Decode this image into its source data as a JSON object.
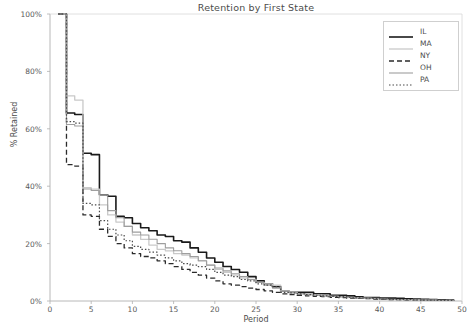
{
  "chart": {
    "title": "Retention by First State",
    "xlabel": "Period",
    "ylabel": "% Retained"
  },
  "axes": {
    "xticks": [
      "0",
      "5",
      "10",
      "15",
      "20",
      "25",
      "30",
      "35",
      "40",
      "45",
      "50"
    ],
    "yticks": [
      "0%",
      "20%",
      "40%",
      "60%",
      "80%",
      "100%"
    ]
  },
  "legend": {
    "items": [
      {
        "label": "IL",
        "style": "solid",
        "color": "#1a1a1a",
        "width": 1.6,
        "dash": "none"
      },
      {
        "label": "MA",
        "style": "solid-light",
        "color": "#c9c9c9",
        "width": 1.3,
        "dash": "none"
      },
      {
        "label": "NY",
        "style": "dashed",
        "color": "#2b2b2b",
        "width": 1.3,
        "dash": "5,3"
      },
      {
        "label": "OH",
        "style": "solid-gray",
        "color": "#9e9e9e",
        "width": 1.1,
        "dash": "none"
      },
      {
        "label": "PA",
        "style": "dotted",
        "color": "#4a4a4a",
        "width": 1.2,
        "dash": "1.5,2"
      }
    ]
  },
  "chart_data": {
    "type": "line",
    "title": "Retention by First State",
    "xlabel": "Period",
    "ylabel": "% Retained",
    "xlim": [
      0,
      50
    ],
    "ylim": [
      0,
      100
    ],
    "grid": false,
    "legend_position": "upper right",
    "x": [
      1,
      2,
      3,
      4,
      5,
      6,
      7,
      8,
      9,
      10,
      11,
      12,
      13,
      14,
      15,
      16,
      17,
      18,
      19,
      20,
      21,
      22,
      23,
      24,
      25,
      26,
      27,
      28,
      29,
      30,
      31,
      32,
      33,
      34,
      35,
      36,
      37,
      38,
      39,
      40,
      41,
      42,
      43,
      44,
      45,
      46,
      47,
      48,
      49
    ],
    "series": [
      {
        "name": "IL",
        "color": "#1a1a1a",
        "linestyle": "solid",
        "values": [
          100,
          65.5,
          65.0,
          51.5,
          51.0,
          37.0,
          36.5,
          29.5,
          29.0,
          27.0,
          25.5,
          24.5,
          23.0,
          22.5,
          21.0,
          20.5,
          18.5,
          17.0,
          15.0,
          13.5,
          12.0,
          11.0,
          10.0,
          8.5,
          7.0,
          6.0,
          5.0,
          3.5,
          3.0,
          3.0,
          3.0,
          2.5,
          2.5,
          2.0,
          2.0,
          1.8,
          1.5,
          1.2,
          1.2,
          1.0,
          1.0,
          0.9,
          0.8,
          0.7,
          0.6,
          0.5,
          0.4,
          0.3,
          0.2
        ]
      },
      {
        "name": "MA",
        "color": "#c9c9c9",
        "linestyle": "solid",
        "values": [
          100,
          71.5,
          70.0,
          39.5,
          39.0,
          33.5,
          30.0,
          27.5,
          26.0,
          23.0,
          21.5,
          19.5,
          18.0,
          17.5,
          16.5,
          16.0,
          15.0,
          14.0,
          12.5,
          11.0,
          10.0,
          9.0,
          8.0,
          7.5,
          6.5,
          6.0,
          5.5,
          3.5,
          3.0,
          2.5,
          2.2,
          2.0,
          1.8,
          1.6,
          1.4,
          1.2,
          1.0,
          0.9,
          0.8,
          0.6,
          0.5,
          0.5,
          0.4,
          0.4,
          0.3,
          0.3,
          0.2,
          0.2,
          0.1
        ]
      },
      {
        "name": "NY",
        "color": "#2b2b2b",
        "linestyle": "dashed",
        "values": [
          100,
          47.5,
          47.0,
          30.0,
          29.5,
          25.0,
          22.5,
          20.0,
          18.5,
          16.5,
          15.5,
          15.0,
          14.0,
          13.0,
          12.0,
          11.0,
          10.0,
          9.0,
          8.0,
          7.0,
          6.0,
          5.5,
          5.0,
          4.5,
          4.0,
          3.5,
          3.0,
          2.5,
          2.2,
          2.0,
          1.8,
          1.6,
          1.5,
          1.3,
          1.2,
          1.0,
          0.9,
          0.8,
          0.7,
          0.6,
          0.5,
          0.5,
          0.4,
          0.4,
          0.3,
          0.3,
          0.2,
          0.2,
          0.1
        ]
      },
      {
        "name": "OH",
        "color": "#9e9e9e",
        "linestyle": "solid",
        "values": [
          100,
          61.5,
          61.0,
          39.0,
          38.5,
          37.0,
          31.5,
          29.0,
          26.0,
          24.0,
          23.0,
          21.5,
          20.0,
          18.5,
          17.5,
          16.5,
          15.5,
          14.0,
          12.5,
          11.5,
          10.5,
          9.5,
          8.5,
          7.5,
          6.5,
          5.5,
          4.5,
          3.5,
          3.0,
          2.5,
          2.2,
          2.0,
          1.8,
          1.6,
          1.5,
          1.3,
          1.1,
          1.0,
          0.9,
          0.7,
          0.6,
          0.5,
          0.5,
          0.4,
          0.3,
          0.3,
          0.2,
          0.2,
          0.1
        ]
      },
      {
        "name": "PA",
        "color": "#4a4a4a",
        "linestyle": "dotted",
        "values": [
          100,
          62.5,
          62.0,
          34.0,
          33.5,
          28.0,
          25.0,
          23.0,
          21.0,
          19.0,
          18.0,
          17.0,
          16.0,
          15.0,
          14.0,
          13.0,
          12.5,
          12.0,
          11.0,
          10.0,
          9.0,
          8.5,
          7.5,
          7.0,
          6.0,
          5.5,
          5.0,
          3.0,
          2.8,
          2.5,
          2.2,
          2.0,
          1.8,
          1.6,
          1.5,
          1.3,
          1.1,
          1.0,
          0.9,
          0.7,
          0.6,
          0.5,
          0.5,
          0.4,
          0.3,
          0.3,
          0.2,
          0.2,
          0.1
        ]
      }
    ]
  }
}
